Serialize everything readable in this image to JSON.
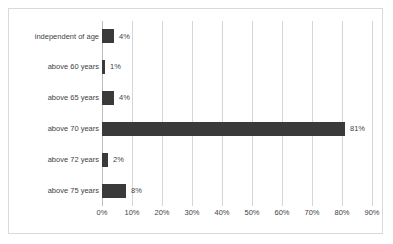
{
  "chart_data": {
    "type": "bar",
    "orientation": "horizontal",
    "title": "",
    "xlabel": "",
    "ylabel": "",
    "categories": [
      "independent of age",
      "above 60 years",
      "above 65 years",
      "above 70 years",
      "above 72 years",
      "above 75 years"
    ],
    "values": [
      4,
      1,
      4,
      81,
      2,
      8
    ],
    "value_labels": [
      "4%",
      "1%",
      "4%",
      "81%",
      "2%",
      "8%"
    ],
    "xlim": [
      0,
      90
    ],
    "xticks": [
      0,
      10,
      20,
      30,
      40,
      50,
      60,
      70,
      80,
      90
    ],
    "xtick_labels": [
      "0%",
      "10%",
      "20%",
      "30%",
      "40%",
      "50%",
      "60%",
      "70%",
      "80%",
      "90%"
    ],
    "grid": true,
    "legend": "none",
    "bar_color": "#3a3a3a",
    "gridline_color": "#d6d6d6",
    "frame_color": "#d9d9d9",
    "background_color": "#ffffff",
    "text_color": "#3f3f3f"
  }
}
